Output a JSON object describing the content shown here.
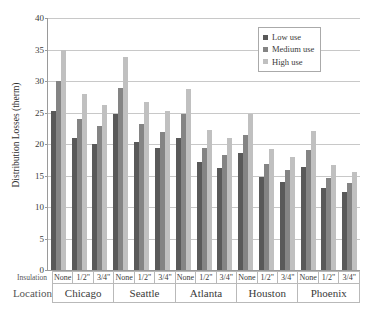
{
  "chart": {
    "ylabel": "Distribution Losses (therm)",
    "yticks": [
      "0",
      "5",
      "10",
      "15",
      "20",
      "25",
      "30",
      "35",
      "40"
    ],
    "row_headers": {
      "insulation": "Insulation",
      "location": "Location"
    }
  },
  "legend": {
    "position": "top-right",
    "items": [
      {
        "label": "Low use",
        "color": "#595959"
      },
      {
        "label": "Medium use",
        "color": "#848484"
      },
      {
        "label": "High use",
        "color": "#c0c0c0"
      }
    ]
  },
  "chart_data": {
    "type": "bar",
    "title": "",
    "xlabel": "",
    "ylabel": "Distribution Losses (therm)",
    "ylim": [
      0,
      40
    ],
    "ytick_step": 5,
    "grid": true,
    "legend_position": "top-right",
    "group_levels": [
      "Location",
      "Insulation"
    ],
    "locations": [
      "Chicago",
      "Seattle",
      "Atlanta",
      "Houston",
      "Phoenix"
    ],
    "insulation": [
      "None",
      "1/2\"",
      "3/4\""
    ],
    "categories": [
      "Chicago None",
      "Chicago 1/2\"",
      "Chicago 3/4\"",
      "Seattle None",
      "Seattle 1/2\"",
      "Seattle 3/4\"",
      "Atlanta None",
      "Atlanta 1/2\"",
      "Atlanta 3/4\"",
      "Houston None",
      "Houston 1/2\"",
      "Houston 3/4\"",
      "Phoenix None",
      "Phoenix 1/2\"",
      "Phoenix 3/4\""
    ],
    "series": [
      {
        "name": "Low use",
        "color": "#595959",
        "values": [
          25.3,
          21.0,
          20.0,
          24.7,
          20.3,
          19.3,
          21.0,
          17.1,
          16.2,
          18.5,
          14.8,
          14.0,
          16.3,
          13.0,
          12.4
        ]
      },
      {
        "name": "Medium use",
        "color": "#848484",
        "values": [
          30.0,
          24.0,
          22.8,
          28.9,
          23.2,
          21.9,
          24.7,
          19.4,
          18.2,
          21.5,
          16.8,
          15.8,
          19.1,
          14.6,
          13.8
        ]
      },
      {
        "name": "High use",
        "color": "#c0c0c0",
        "values": [
          35.0,
          27.9,
          26.2,
          33.8,
          26.6,
          25.2,
          28.7,
          22.3,
          20.9,
          24.8,
          19.2,
          17.9,
          22.1,
          16.7,
          15.6
        ]
      }
    ]
  }
}
